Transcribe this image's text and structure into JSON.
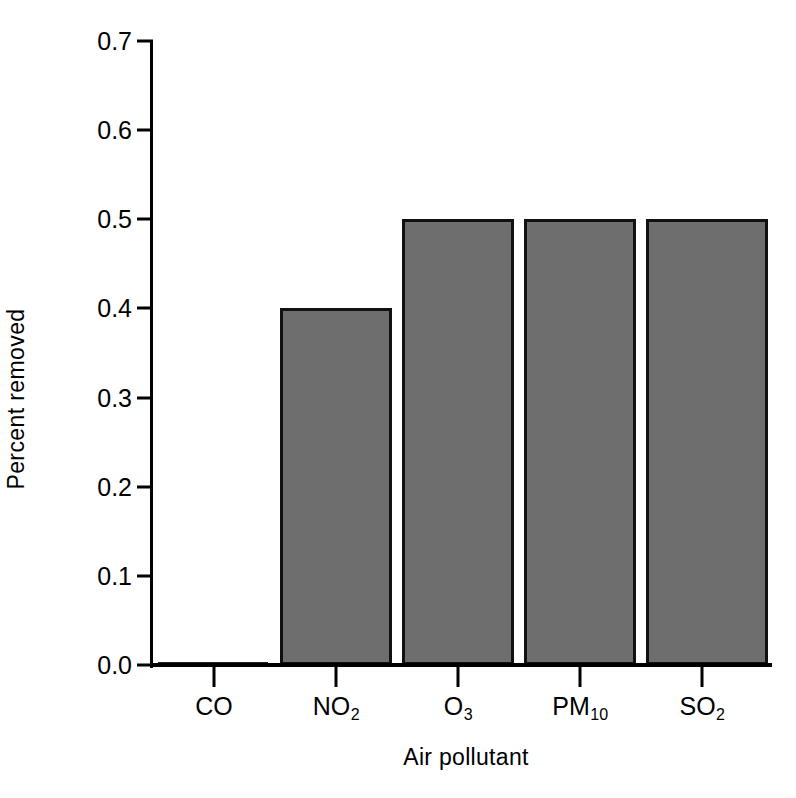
{
  "chart_data": {
    "type": "bar",
    "title": "",
    "subtitle": "",
    "xlabel": "Air pollutant",
    "ylabel": "Percent removed",
    "categories": [
      "CO",
      "NO2",
      "O3",
      "PM10",
      "SO2"
    ],
    "category_labels": [
      {
        "base": "CO",
        "sub": ""
      },
      {
        "base": "NO",
        "sub": "2"
      },
      {
        "base": "O",
        "sub": "3"
      },
      {
        "base": "PM",
        "sub": "10"
      },
      {
        "base": "SO",
        "sub": "2"
      }
    ],
    "values": [
      0.0,
      0.4,
      0.5,
      0.5,
      0.5
    ],
    "ylim": [
      0.0,
      0.7
    ],
    "ytick_values": [
      0.0,
      0.1,
      0.2,
      0.3,
      0.4,
      0.5,
      0.6,
      0.7
    ],
    "ytick_labels": [
      "0.0",
      "0.1",
      "0.2",
      "0.3",
      "0.4",
      "0.5",
      "0.6",
      "0.7"
    ],
    "grid": false,
    "legend": null,
    "legend_position": "none",
    "bar_fill_color": "#6e6e6e",
    "bar_edge_color": "#111111",
    "axis_color": "#000000",
    "background_color": "#ffffff"
  },
  "axes": {
    "y_title": "Percent removed",
    "x_title": "Air pollutant"
  }
}
